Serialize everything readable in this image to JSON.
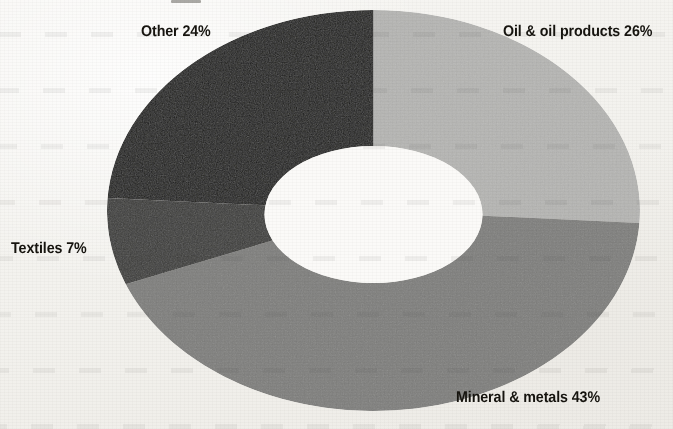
{
  "chart_data": {
    "type": "pie",
    "variant": "donut",
    "title": "",
    "subtitle": "",
    "xlabel": "",
    "ylabel": "",
    "grid": false,
    "legend_position": "none",
    "label_style": "outside-direct-labels",
    "units": "percent",
    "total": 100,
    "start_angle_deg": 0,
    "direction": "clockwise",
    "categories": [
      "Oil & oil products",
      "Mineral & metals",
      "Textiles",
      "Other"
    ],
    "values": [
      26,
      43,
      7,
      24
    ],
    "slices": [
      {
        "name": "Oil & oil products",
        "value": 26,
        "label": "Oil & oil products 26%",
        "color": "#b6b6b4",
        "start_deg": 0,
        "end_deg": 93.6
      },
      {
        "name": "Mineral & metals",
        "value": 43,
        "label": "Mineral & metals 43%",
        "color": "#7f7f7d",
        "start_deg": 93.6,
        "end_deg": 248.4
      },
      {
        "name": "Textiles",
        "value": 7,
        "label": "Textiles 7%",
        "color": "#3b3b39",
        "start_deg": 248.4,
        "end_deg": 273.6
      },
      {
        "name": "Other",
        "value": 24,
        "label": "Other 24%",
        "color": "#1b1b19",
        "start_deg": 273.6,
        "end_deg": 360
      }
    ]
  },
  "labels": {
    "oil": "Oil & oil products 26%",
    "mineral": "Mineral & metals 43%",
    "textiles": "Textiles 7%",
    "other": "Other 24%"
  },
  "colors": {
    "background": "#f6f5f2",
    "text": "#16140f",
    "oil": "#b6b6b4",
    "mineral": "#7f7f7d",
    "textiles": "#3b3b39",
    "other": "#1b1b19",
    "hole": "#fbfaf8"
  }
}
